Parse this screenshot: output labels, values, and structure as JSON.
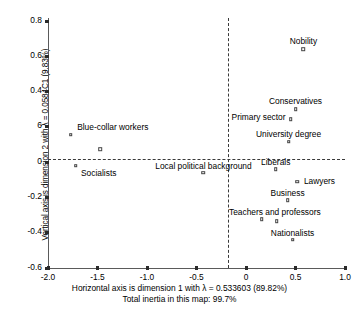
{
  "chart_data": {
    "type": "scatter",
    "title": "",
    "xlabel": "Horizontal axis is dimension 1 with λ = 0.533603 (89.82%)",
    "ylabel": "Vertical axis is dimension 2 with λ = 0.0584C1 (9.83%)",
    "subtitle": "Total inertia in this map: 99.7%",
    "xlim": [
      -2.0,
      1.0
    ],
    "ylim": [
      -0.6,
      0.8
    ],
    "xticks": [
      "-2.0",
      "-1.5",
      "-1.0",
      "-0.5",
      "0",
      "0.5",
      "1.0"
    ],
    "xtick_values": [
      -2.0,
      -1.5,
      -1.0,
      -0.5,
      0,
      0.5,
      1.0
    ],
    "yticks": [
      "0.8",
      "0.6",
      "0.4",
      "6",
      "0",
      "-0.2",
      "-0.4",
      "-0.6"
    ],
    "ytick_values": [
      0.8,
      0.6,
      0.4,
      0.2,
      0,
      -0.2,
      -0.4,
      -0.6
    ],
    "grid": false,
    "legend": "none",
    "zero_lines": {
      "horizontal": 0,
      "vertical": 0,
      "style": "dashed"
    },
    "points": [
      {
        "label": "Nobility",
        "x": 0.58,
        "y": 0.64,
        "label_dx": 0,
        "label_dy": -13
      },
      {
        "label": "Conservatives",
        "x": 0.5,
        "y": 0.3,
        "label_dx": 0,
        "label_dy": -13
      },
      {
        "label": "Primary sector",
        "x": 0.45,
        "y": 0.245,
        "label_dx": -32,
        "label_dy": -7
      },
      {
        "label": "University degree",
        "x": 0.43,
        "y": 0.115,
        "label_dx": 0,
        "label_dy": -13
      },
      {
        "label": "Blue-collar workers",
        "x": -1.77,
        "y": 0.155,
        "label_dx": 42,
        "label_dy": -13
      },
      {
        "label": "",
        "x": -1.47,
        "y": 0.075,
        "label_dx": 0,
        "label_dy": 0
      },
      {
        "label": "Socialists",
        "x": -1.72,
        "y": -0.02,
        "label_dx": 23,
        "label_dy": 2
      },
      {
        "label": "Local political background",
        "x": -0.43,
        "y": -0.06,
        "label_dx": 0,
        "label_dy": -12
      },
      {
        "label": "Liberals",
        "x": 0.3,
        "y": -0.04,
        "label_dx": 0,
        "label_dy": -12
      },
      {
        "label": "Lawyers",
        "x": 0.52,
        "y": -0.11,
        "label_dx": 22,
        "label_dy": -6
      },
      {
        "label": "Business",
        "x": 0.42,
        "y": -0.215,
        "label_dx": 0,
        "label_dy": -12
      },
      {
        "label": "Teachers and professors",
        "x": 0.16,
        "y": -0.325,
        "label_dx": 13,
        "label_dy": -12
      },
      {
        "label": "",
        "x": 0.31,
        "y": -0.335,
        "label_dx": 0,
        "label_dy": 0
      },
      {
        "label": "Nationalists",
        "x": 0.47,
        "y": -0.44,
        "label_dx": 0,
        "label_dy": -12
      }
    ]
  }
}
